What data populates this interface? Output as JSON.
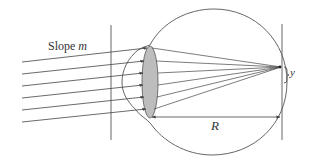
{
  "diagram": {
    "labels": {
      "slope_text": "Slope ",
      "slope_var": "m",
      "radius": "R",
      "offset": "y"
    },
    "colors": {
      "line": "#444444",
      "lens_fill": "#bdbdbd",
      "background": "#ffffff"
    },
    "elements": [
      "incoming-parallel-rays (6)",
      "left-reference-plane",
      "eyeball-outline",
      "cornea-bulge",
      "lens",
      "converging-rays",
      "focal-point-on-retina",
      "right-reference-plane",
      "radius-dimension-R",
      "offset-brace-y"
    ]
  }
}
